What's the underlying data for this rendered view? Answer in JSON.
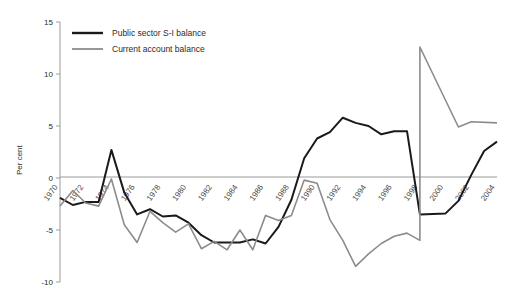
{
  "chart_data": {
    "type": "line",
    "title": "",
    "xlabel": "",
    "ylabel": "Per cent",
    "ylim": [
      -10,
      15
    ],
    "xlim": [
      1970,
      2004
    ],
    "grid": false,
    "legend_position": "top-left",
    "ytick_labels": [
      "15",
      "10",
      "5",
      "0",
      "-5",
      "-10"
    ],
    "ytick_values": [
      15,
      10,
      5,
      0,
      -5,
      -10
    ],
    "xtick_labels": [
      "1970",
      "1972",
      "1974",
      "1976",
      "1978",
      "1980",
      "1982",
      "1984",
      "1986",
      "1988",
      "1990",
      "1992",
      "1994",
      "1996",
      "1998",
      "2000",
      "2002",
      "2004"
    ],
    "xtick_values": [
      1970,
      1972,
      1974,
      1976,
      1978,
      1980,
      1982,
      1984,
      1986,
      1988,
      1990,
      1992,
      1994,
      1996,
      1998,
      2000,
      2002,
      2004
    ],
    "x": [
      1970,
      1971,
      1972,
      1973,
      1974,
      1975,
      1976,
      1977,
      1978,
      1979,
      1980,
      1981,
      1982,
      1983,
      1984,
      1985,
      1986,
      1987,
      1988,
      1989,
      1990,
      1991,
      1992,
      1993,
      1994,
      1995,
      1996,
      1997,
      1998,
      1999,
      2000,
      2001,
      2002,
      2003,
      2004
    ],
    "series": [
      {
        "name": "Public sector S-I balance",
        "color": "#1a1a1a",
        "width": 2.0,
        "values": [
          -1.9,
          -2.6,
          -2.3,
          -2.3,
          2.7,
          -1.4,
          -3.5,
          -3.0,
          -3.7,
          -3.6,
          -4.3,
          -5.5,
          -6.2,
          -6.2,
          -6.2,
          -5.9,
          -6.3,
          -4.7,
          -2.1,
          1.9,
          3.8,
          4.4,
          5.8,
          5.3,
          5.0,
          4.2,
          4.5,
          4.5,
          4.5,
          4.0,
          2.6,
          0.5,
          -1.5,
          -3.5,
          -3.5
        ]
      },
      {
        "name": "Current account balance",
        "color": "#8c8c8c",
        "width": 1.6,
        "values": [
          -2.7,
          -1.2,
          -2.4,
          -2.7,
          -0.1,
          -4.5,
          -6.2,
          -3.2,
          -4.3,
          -5.2,
          -4.4,
          -6.8,
          -6.1,
          -6.9,
          -5.0,
          -6.9,
          -3.6,
          -4.1,
          -3.6,
          -0.2,
          -0.5,
          -4.0,
          -6.0,
          -8.5,
          -7.3,
          -6.3,
          -5.6,
          -5.3,
          -6.0,
          -8.2,
          -8.3,
          12.6,
          9.0,
          5.2,
          5.3
        ]
      }
    ],
    "series_extra": {
      "black_tail": [
        [
          1998,
          -3.5
        ],
        [
          2000,
          -3.4
        ],
        [
          2001,
          -2.2
        ],
        [
          2002,
          0.3
        ],
        [
          2003,
          2.6
        ],
        [
          2004,
          3.5
        ]
      ],
      "grey_tail": [
        [
          1998,
          12.6
        ],
        [
          2001,
          4.9
        ],
        [
          2002,
          5.4
        ],
        [
          2004,
          5.3
        ]
      ]
    }
  },
  "legend": {
    "items": [
      {
        "label": "Public sector S-I balance",
        "color": "#1a1a1a"
      },
      {
        "label": "Current account balance",
        "color": "#8c8c8c"
      }
    ]
  }
}
